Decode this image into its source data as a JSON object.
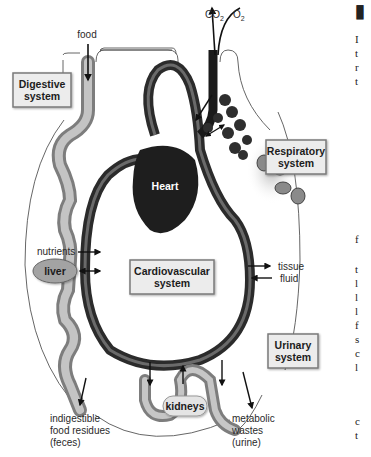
{
  "diagram": {
    "inputs": {
      "food": "food",
      "co2_main": "CO",
      "co2_sub": "2",
      "o2_main": "O",
      "o2_sub": "2"
    },
    "systems": {
      "digestive": [
        "Digestive",
        "system"
      ],
      "respiratory": [
        "Respiratory",
        "system"
      ],
      "cardiovascular": [
        "Cardiovascular",
        "system"
      ],
      "urinary": [
        "Urinary",
        "system"
      ]
    },
    "organs": {
      "heart": "Heart",
      "liver": "liver",
      "kidneys": "kidneys"
    },
    "labels": {
      "nutrients": "nutrients",
      "cells": "cells",
      "tissue_fluid": [
        "tissue",
        "fluid"
      ],
      "feces": [
        "indigestible",
        "food residues",
        "(feces)"
      ],
      "urine": [
        "metabolic",
        "wastes",
        "(urine)"
      ]
    },
    "colors": {
      "vessel_dark": "#2b2b2b",
      "vessel_mid": "#5a5a5a",
      "gut": "#a8a8a8",
      "box_fill": "#ececec",
      "box_border": "#7a7a7a",
      "outline": "#555555"
    }
  },
  "page_edge": {
    "heading_block": "▮",
    "lines_top": [
      "I",
      "t",
      "r",
      "t"
    ],
    "lines_mid": [
      "f"
    ],
    "lines_bottom": [
      "t",
      "l",
      "l",
      "l",
      "f",
      "s",
      "c",
      "l"
    ],
    "lines_end": [
      "c",
      "t"
    ]
  }
}
